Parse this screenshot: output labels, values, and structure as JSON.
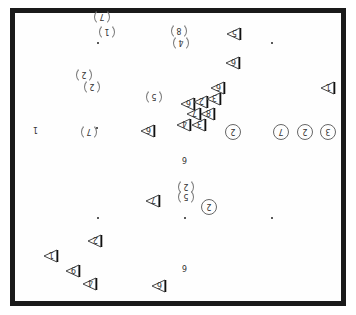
{
  "diagram": {
    "type": "board-diagram",
    "border_color": "#1a1a1a",
    "star_points": [
      {
        "x": 98,
        "y": 43
      },
      {
        "x": 272,
        "y": 43
      },
      {
        "x": 98,
        "y": 218
      },
      {
        "x": 272,
        "y": 218
      },
      {
        "x": 185,
        "y": 218
      },
      {
        "x": 97,
        "y": 128
      }
    ],
    "circle_marks": [
      {
        "x": 101,
        "y": 16,
        "label": "7",
        "partial": true
      },
      {
        "x": 106,
        "y": 31,
        "label": "1",
        "partial": true
      },
      {
        "x": 178,
        "y": 30,
        "label": "8",
        "partial": true
      },
      {
        "x": 180,
        "y": 42,
        "label": "4",
        "partial": true
      },
      {
        "x": 83,
        "y": 74,
        "label": "2",
        "partial": true
      },
      {
        "x": 91,
        "y": 86,
        "label": "2",
        "partial": true
      },
      {
        "x": 153,
        "y": 96,
        "label": "5",
        "partial": true
      },
      {
        "x": 88,
        "y": 131,
        "label": "7",
        "partial": true
      },
      {
        "x": 232,
        "y": 131,
        "label": "2",
        "partial": false
      },
      {
        "x": 280,
        "y": 131,
        "label": "7",
        "partial": false
      },
      {
        "x": 304,
        "y": 131,
        "label": "2",
        "partial": false
      },
      {
        "x": 327,
        "y": 131,
        "label": "3",
        "partial": false
      },
      {
        "x": 185,
        "y": 186,
        "label": "2",
        "partial": true
      },
      {
        "x": 185,
        "y": 196,
        "label": "5",
        "partial": true
      },
      {
        "x": 208,
        "y": 206,
        "label": "2",
        "partial": false
      }
    ],
    "triangle_marks": [
      {
        "x": 234,
        "y": 33,
        "label": "5"
      },
      {
        "x": 233,
        "y": 62,
        "label": "6"
      },
      {
        "x": 218,
        "y": 87,
        "label": "6"
      },
      {
        "x": 328,
        "y": 87,
        "label": "1"
      },
      {
        "x": 188,
        "y": 103,
        "label": "6"
      },
      {
        "x": 201,
        "y": 101,
        "label": "2"
      },
      {
        "x": 214,
        "y": 98,
        "label": "3"
      },
      {
        "x": 194,
        "y": 113,
        "label": "7"
      },
      {
        "x": 208,
        "y": 113,
        "label": "8"
      },
      {
        "x": 184,
        "y": 124,
        "label": "4"
      },
      {
        "x": 199,
        "y": 124,
        "label": "3"
      },
      {
        "x": 148,
        "y": 130,
        "label": "6"
      },
      {
        "x": 153,
        "y": 200,
        "label": "7"
      },
      {
        "x": 95,
        "y": 240,
        "label": "2"
      },
      {
        "x": 51,
        "y": 255,
        "label": "1"
      },
      {
        "x": 73,
        "y": 270,
        "label": "9"
      },
      {
        "x": 90,
        "y": 283,
        "label": "4"
      },
      {
        "x": 159,
        "y": 285,
        "label": "6"
      }
    ],
    "plain_labels": [
      {
        "x": 36,
        "y": 130,
        "label": "1"
      },
      {
        "x": 185,
        "y": 160,
        "label": "6"
      },
      {
        "x": 185,
        "y": 268,
        "label": "6"
      }
    ]
  }
}
